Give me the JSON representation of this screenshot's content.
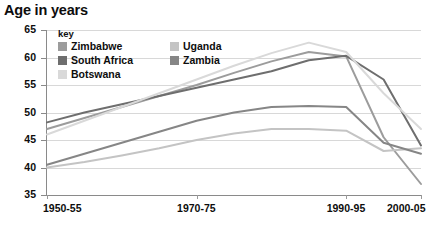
{
  "chart_title": "Age in years",
  "legend": {
    "title": "key",
    "items": [
      {
        "label": "Zimbabwe",
        "color": "#9c9c9c"
      },
      {
        "label": "South Africa",
        "color": "#6e6e6e"
      },
      {
        "label": "Botswana",
        "color": "#d9d9d9"
      },
      {
        "label": "Uganda",
        "color": "#c4c4c4"
      },
      {
        "label": "Zambia",
        "color": "#868686"
      }
    ]
  },
  "chart_data": {
    "type": "line",
    "title": "Age in years",
    "xlabel": "",
    "ylabel": "Age in years",
    "ylim": [
      35,
      65
    ],
    "yticks": [
      35,
      40,
      45,
      50,
      55,
      60,
      65
    ],
    "grid": true,
    "legend_position": "top-left-inside",
    "x": [
      "1950-55",
      "1955-60",
      "1960-65",
      "1965-70",
      "1970-75",
      "1975-80",
      "1980-85",
      "1985-90",
      "1990-95",
      "1995-2000",
      "2000-05"
    ],
    "xtick_labels": [
      "1950-55",
      "1970-75",
      "1990-95",
      "2000-05"
    ],
    "series": [
      {
        "name": "Zimbabwe",
        "color": "#9c9c9c",
        "values": [
          47.0,
          49.0,
          51.0,
          53.0,
          55.0,
          57.2,
          59.3,
          61.0,
          60.2,
          45.5,
          37.0
        ]
      },
      {
        "name": "South Africa",
        "color": "#6e6e6e",
        "values": [
          48.2,
          50.0,
          51.5,
          53.0,
          54.5,
          56.0,
          57.5,
          59.5,
          60.3,
          56.0,
          44.0
        ]
      },
      {
        "name": "Botswana",
        "color": "#d9d9d9",
        "values": [
          46.0,
          48.5,
          51.0,
          53.5,
          56.0,
          58.5,
          60.8,
          62.7,
          61.0,
          53.5,
          47.0
        ]
      },
      {
        "name": "Uganda",
        "color": "#c4c4c4",
        "values": [
          40.0,
          41.0,
          42.2,
          43.5,
          45.0,
          46.2,
          47.0,
          47.0,
          46.7,
          43.0,
          43.5
        ]
      },
      {
        "name": "Zambia",
        "color": "#868686",
        "values": [
          40.5,
          42.5,
          44.5,
          46.5,
          48.5,
          50.0,
          51.0,
          51.2,
          51.0,
          44.5,
          42.5
        ]
      }
    ]
  }
}
